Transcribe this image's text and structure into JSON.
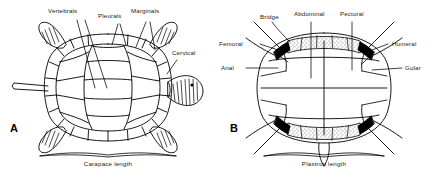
{
  "figure": {
    "background_color": "#ffffff",
    "ink_color": "#000000",
    "text_color": "#1a1a1a",
    "width": 432,
    "height": 180
  },
  "panel_a": {
    "letter": "A",
    "view": "carapace-dorsal-view",
    "measurement_caption": "Carapace length",
    "labels": [
      {
        "name": "vertebrals",
        "text": "Vertebrals"
      },
      {
        "name": "pleurals",
        "text": "Pleurals"
      },
      {
        "name": "marginals",
        "text": "Marginals"
      },
      {
        "name": "cervical",
        "text": "Cervical"
      }
    ]
  },
  "panel_b": {
    "letter": "B",
    "view": "plastron-ventral-view",
    "measurement_caption": "Plastron length",
    "labels": [
      {
        "name": "bridge",
        "text": "Bridge"
      },
      {
        "name": "abdominal",
        "text": "Abdominal"
      },
      {
        "name": "pectoral",
        "text": "Pectoral"
      },
      {
        "name": "femoral",
        "text": "Femoral"
      },
      {
        "name": "anal",
        "text": "Anal"
      },
      {
        "name": "humeral",
        "text": "Humeral"
      },
      {
        "name": "gular",
        "text": "Gular"
      }
    ]
  }
}
